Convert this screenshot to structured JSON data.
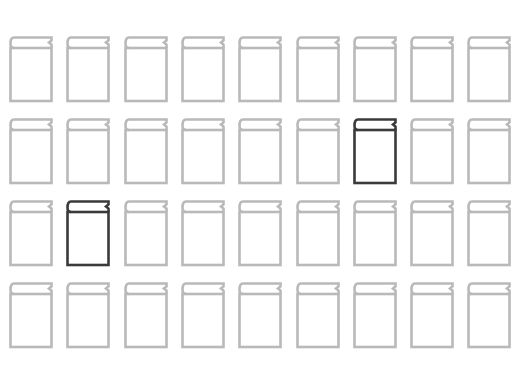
{
  "grid": {
    "rows": 4,
    "columns": 9,
    "origin_x": 8,
    "origin_y": 35,
    "col_pitch": 57.3,
    "row_pitch": 82
  },
  "colors": {
    "default": "#b9b9b9",
    "highlighted": "#3a3a3a",
    "background": "#ffffff"
  },
  "icon": "book-icon",
  "highlighted": [
    {
      "row": 2,
      "col": 7
    },
    {
      "row": 3,
      "col": 2
    }
  ],
  "books": [
    {
      "row": 1,
      "col": 1,
      "state": "default"
    },
    {
      "row": 1,
      "col": 2,
      "state": "default"
    },
    {
      "row": 1,
      "col": 3,
      "state": "default"
    },
    {
      "row": 1,
      "col": 4,
      "state": "default"
    },
    {
      "row": 1,
      "col": 5,
      "state": "default"
    },
    {
      "row": 1,
      "col": 6,
      "state": "default"
    },
    {
      "row": 1,
      "col": 7,
      "state": "default"
    },
    {
      "row": 1,
      "col": 8,
      "state": "default"
    },
    {
      "row": 1,
      "col": 9,
      "state": "default"
    },
    {
      "row": 2,
      "col": 1,
      "state": "default"
    },
    {
      "row": 2,
      "col": 2,
      "state": "default"
    },
    {
      "row": 2,
      "col": 3,
      "state": "default"
    },
    {
      "row": 2,
      "col": 4,
      "state": "default"
    },
    {
      "row": 2,
      "col": 5,
      "state": "default"
    },
    {
      "row": 2,
      "col": 6,
      "state": "default"
    },
    {
      "row": 2,
      "col": 7,
      "state": "highlighted"
    },
    {
      "row": 2,
      "col": 8,
      "state": "default"
    },
    {
      "row": 2,
      "col": 9,
      "state": "default"
    },
    {
      "row": 3,
      "col": 1,
      "state": "default"
    },
    {
      "row": 3,
      "col": 2,
      "state": "highlighted"
    },
    {
      "row": 3,
      "col": 3,
      "state": "default"
    },
    {
      "row": 3,
      "col": 4,
      "state": "default"
    },
    {
      "row": 3,
      "col": 5,
      "state": "default"
    },
    {
      "row": 3,
      "col": 6,
      "state": "default"
    },
    {
      "row": 3,
      "col": 7,
      "state": "default"
    },
    {
      "row": 3,
      "col": 8,
      "state": "default"
    },
    {
      "row": 3,
      "col": 9,
      "state": "default"
    },
    {
      "row": 4,
      "col": 1,
      "state": "default"
    },
    {
      "row": 4,
      "col": 2,
      "state": "default"
    },
    {
      "row": 4,
      "col": 3,
      "state": "default"
    },
    {
      "row": 4,
      "col": 4,
      "state": "default"
    },
    {
      "row": 4,
      "col": 5,
      "state": "default"
    },
    {
      "row": 4,
      "col": 6,
      "state": "default"
    },
    {
      "row": 4,
      "col": 7,
      "state": "default"
    },
    {
      "row": 4,
      "col": 8,
      "state": "default"
    },
    {
      "row": 4,
      "col": 9,
      "state": "default"
    }
  ]
}
